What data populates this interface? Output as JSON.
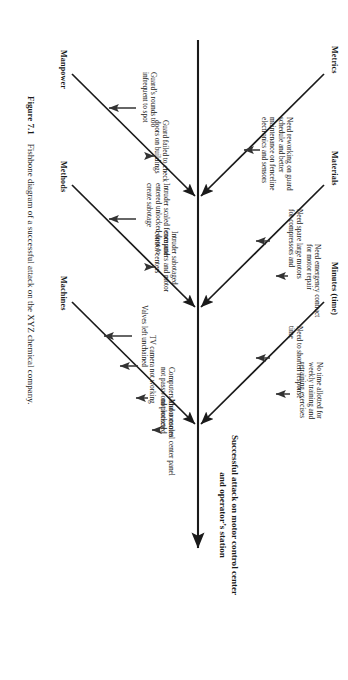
{
  "figure": {
    "number": "Figure 7.1",
    "caption": "Fishbone diagram of a successful attack on the XYZ chemical company."
  },
  "diagram": {
    "type": "fishbone",
    "effect": "Successful attack on motor control center and operator’s station",
    "categories": [
      {
        "label": "Manpower",
        "side": "top",
        "causes": [
          "Guard’s rounds too infrequent to spot",
          "Guard failed to check doors on buildings"
        ]
      },
      {
        "label": "Methods",
        "side": "top",
        "causes": [
          "Intruder scaled fence and entered unlocked door to create sabotage",
          "Intruder sabotaged computers and motor control centers"
        ]
      },
      {
        "label": "Machines",
        "side": "top",
        "causes": [
          "Valves left unchained",
          "TV camera not working",
          "Computers and consoles not password protected",
          "Motor control center panel not locked"
        ]
      },
      {
        "label": "Metrics",
        "side": "bottom",
        "causes": [
          "Need reworking on guard schedule and better maintenance on fenceline electronics and sensors"
        ]
      },
      {
        "label": "Materials",
        "side": "bottom",
        "causes": [
          "Need spare large motors for compressors and",
          "Need emergency contract for motor repair"
        ]
      },
      {
        "label": "Minutes (time)",
        "side": "bottom",
        "causes": [
          "Need to shorten response time",
          "No time allotted for weekly training and retraining exercises"
        ]
      }
    ]
  },
  "colors": {
    "ink": "#1a1a1a",
    "paper": "#ffffff"
  }
}
